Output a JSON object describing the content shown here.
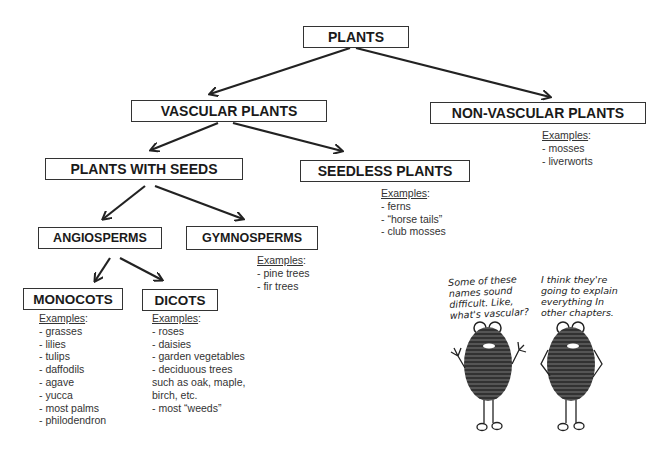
{
  "nodes": {
    "plants": "PLANTS",
    "vascular": "VASCULAR PLANTS",
    "nonvascular": "NON-VASCULAR PLANTS",
    "seeds": "PLANTS WITH SEEDS",
    "seedless": "SEEDLESS PLANTS",
    "angiosperms": "ANGIOSPERMS",
    "gymnosperms": "GYMNOSPERMS",
    "monocots": "MONOCOTS",
    "dicots": "DICOTS"
  },
  "examples": {
    "heading": "Examples",
    "nonvascular": [
      "- mosses",
      "- liverworts"
    ],
    "seedless": [
      "- ferns",
      "- “horse tails”",
      "- club mosses"
    ],
    "gymnosperms": [
      "- pine trees",
      "- fir trees"
    ],
    "monocots": [
      "- grasses",
      "- lilies",
      "- tulips",
      "- daffodils",
      "- agave",
      "- yucca",
      "- most palms",
      "- philodendron"
    ],
    "dicots": [
      "- roses",
      "- daisies",
      "- garden vegetables",
      "- deciduous trees",
      "such as oak, maple,",
      "birch, etc.",
      "- most “weeds”"
    ]
  },
  "cartoon": {
    "left_speech": [
      "Some of these",
      "names sound",
      "difficult. Like,",
      "what's vascular?"
    ],
    "right_speech": [
      "I think they're",
      "going to explain",
      "everything In",
      "other chapters."
    ]
  },
  "colors": {
    "line": "#222222",
    "box_border": "#333333",
    "background": "#ffffff"
  }
}
